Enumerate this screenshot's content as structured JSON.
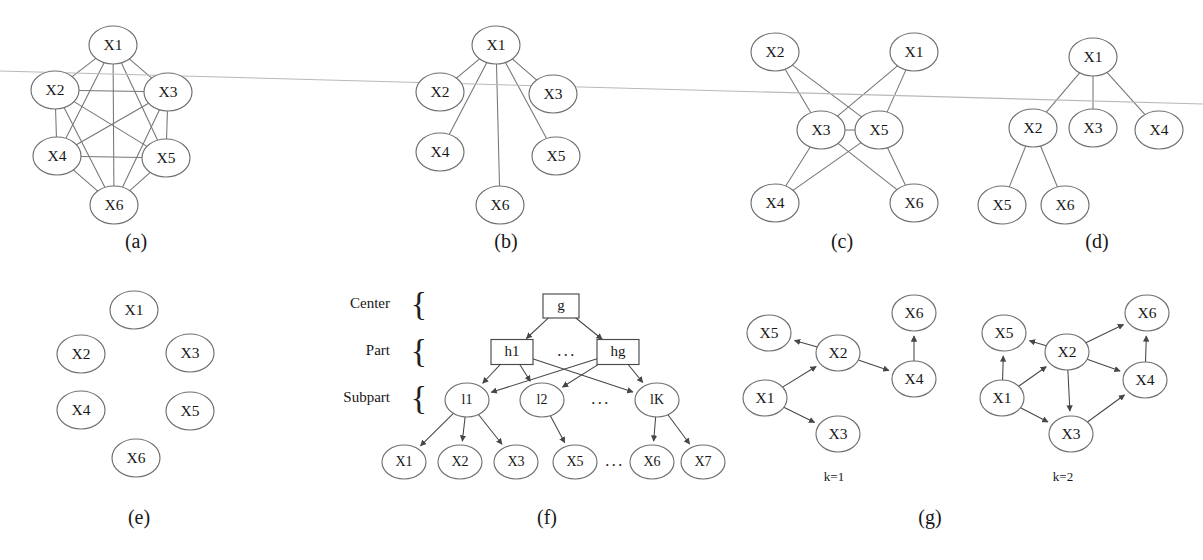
{
  "figure": {
    "background_color": "#ffffff",
    "node_stroke_color": "#6f6f70",
    "edge_color": "#74747a",
    "text_color": "#171717",
    "scan_artifact_color": "#b9b9bc"
  },
  "panels": [
    {
      "id": "a",
      "caption": "(a)",
      "type": "undirected-complete-graph",
      "nodes": [
        {
          "id": "X1",
          "label": "X1",
          "cx": 113,
          "cy": 45
        },
        {
          "id": "X2",
          "label": "X2",
          "cx": 55,
          "cy": 90
        },
        {
          "id": "X3",
          "label": "X3",
          "cx": 168,
          "cy": 92
        },
        {
          "id": "X4",
          "label": "X4",
          "cx": 57,
          "cy": 156
        },
        {
          "id": "X5",
          "label": "X5",
          "cx": 166,
          "cy": 158
        },
        {
          "id": "X6",
          "label": "X6",
          "cx": 114,
          "cy": 205
        }
      ],
      "edges": [
        [
          "X1",
          "X2"
        ],
        [
          "X1",
          "X3"
        ],
        [
          "X1",
          "X4"
        ],
        [
          "X1",
          "X5"
        ],
        [
          "X1",
          "X6"
        ],
        [
          "X2",
          "X3"
        ],
        [
          "X2",
          "X4"
        ],
        [
          "X2",
          "X5"
        ],
        [
          "X2",
          "X6"
        ],
        [
          "X3",
          "X4"
        ],
        [
          "X3",
          "X5"
        ],
        [
          "X3",
          "X6"
        ],
        [
          "X4",
          "X5"
        ],
        [
          "X4",
          "X6"
        ],
        [
          "X5",
          "X6"
        ]
      ]
    },
    {
      "id": "b",
      "caption": "(b)",
      "type": "undirected-star-graph",
      "nodes": [
        {
          "id": "X1",
          "label": "X1",
          "cx": 496,
          "cy": 45
        },
        {
          "id": "X2",
          "label": "X2",
          "cx": 440,
          "cy": 92
        },
        {
          "id": "X3",
          "label": "X3",
          "cx": 553,
          "cy": 94
        },
        {
          "id": "X4",
          "label": "X4",
          "cx": 440,
          "cy": 152
        },
        {
          "id": "X5",
          "label": "X5",
          "cx": 556,
          "cy": 156
        },
        {
          "id": "X6",
          "label": "X6",
          "cx": 500,
          "cy": 205
        }
      ],
      "edges": [
        [
          "X1",
          "X2"
        ],
        [
          "X1",
          "X3"
        ],
        [
          "X1",
          "X4"
        ],
        [
          "X1",
          "X5"
        ],
        [
          "X1",
          "X6"
        ]
      ]
    },
    {
      "id": "c",
      "caption": "(c)",
      "type": "undirected-graph",
      "nodes": [
        {
          "id": "X2",
          "label": "X2",
          "cx": 775,
          "cy": 52
        },
        {
          "id": "X1",
          "label": "X1",
          "cx": 914,
          "cy": 52
        },
        {
          "id": "X3",
          "label": "X3",
          "cx": 821,
          "cy": 130
        },
        {
          "id": "X5",
          "label": "X5",
          "cx": 879,
          "cy": 130
        },
        {
          "id": "X4",
          "label": "X4",
          "cx": 775,
          "cy": 203
        },
        {
          "id": "X6",
          "label": "X6",
          "cx": 914,
          "cy": 203
        }
      ],
      "edges": [
        [
          "X3",
          "X5"
        ],
        [
          "X2",
          "X3"
        ],
        [
          "X2",
          "X5"
        ],
        [
          "X1",
          "X3"
        ],
        [
          "X1",
          "X5"
        ],
        [
          "X4",
          "X3"
        ],
        [
          "X4",
          "X5"
        ],
        [
          "X6",
          "X3"
        ],
        [
          "X6",
          "X5"
        ]
      ]
    },
    {
      "id": "d",
      "caption": "(d)",
      "type": "undirected-tree",
      "nodes": [
        {
          "id": "X1",
          "label": "X1",
          "cx": 1093,
          "cy": 57
        },
        {
          "id": "X2",
          "label": "X2",
          "cx": 1033,
          "cy": 128
        },
        {
          "id": "X3",
          "label": "X3",
          "cx": 1093,
          "cy": 128
        },
        {
          "id": "X4",
          "label": "X4",
          "cx": 1159,
          "cy": 130
        },
        {
          "id": "X5",
          "label": "X5",
          "cx": 1002,
          "cy": 205
        },
        {
          "id": "X6",
          "label": "X6",
          "cx": 1065,
          "cy": 205
        }
      ],
      "edges": [
        [
          "X1",
          "X2"
        ],
        [
          "X1",
          "X3"
        ],
        [
          "X1",
          "X4"
        ],
        [
          "X2",
          "X5"
        ],
        [
          "X2",
          "X6"
        ]
      ]
    },
    {
      "id": "e",
      "caption": "(e)",
      "type": "empty-graph",
      "nodes": [
        {
          "id": "X1",
          "label": "X1",
          "cx": 134,
          "cy": 310
        },
        {
          "id": "X2",
          "label": "X2",
          "cx": 81,
          "cy": 354
        },
        {
          "id": "X3",
          "label": "X3",
          "cx": 190,
          "cy": 353
        },
        {
          "id": "X4",
          "label": "X4",
          "cx": 81,
          "cy": 410
        },
        {
          "id": "X5",
          "label": "X5",
          "cx": 190,
          "cy": 411
        },
        {
          "id": "X6",
          "label": "X6",
          "cx": 136,
          "cy": 458
        }
      ],
      "edges": []
    },
    {
      "id": "f",
      "caption": "(f)",
      "type": "hierarchy-dag",
      "tiers": [
        {
          "label": "Center",
          "brace": "{",
          "label_x": 390,
          "label_y": 305,
          "brace_x": 419,
          "brace_y": 307
        },
        {
          "label": "Part",
          "brace": "{",
          "label_x": 390,
          "label_y": 352,
          "brace_x": 419,
          "brace_y": 354
        },
        {
          "label": "Subpart",
          "brace": "{",
          "label_x": 390,
          "label_y": 399,
          "brace_x": 419,
          "brace_y": 401
        }
      ],
      "boxes": [
        {
          "id": "g",
          "label": "g",
          "cx": 561,
          "cy": 306,
          "w": 36,
          "h": 24
        },
        {
          "id": "h1",
          "label": "h1",
          "cx": 512,
          "cy": 352,
          "w": 42,
          "h": 25
        },
        {
          "id": "hg",
          "label": "hg",
          "cx": 618,
          "cy": 352,
          "w": 42,
          "h": 25
        }
      ],
      "ellipses": [
        {
          "id": "l1",
          "label": "l1",
          "cx": 467,
          "cy": 400
        },
        {
          "id": "l2",
          "label": "l2",
          "cx": 542,
          "cy": 400
        },
        {
          "id": "lK",
          "label": "lK",
          "cx": 657,
          "cy": 400
        },
        {
          "id": "X1",
          "label": "X1",
          "cx": 404,
          "cy": 462
        },
        {
          "id": "X2",
          "label": "X2",
          "cx": 460,
          "cy": 462
        },
        {
          "id": "X3",
          "label": "X3",
          "cx": 516,
          "cy": 462
        },
        {
          "id": "X5",
          "label": "X5",
          "cx": 575,
          "cy": 462
        },
        {
          "id": "X6",
          "label": "X6",
          "cx": 652,
          "cy": 462
        },
        {
          "id": "X7",
          "label": "X7",
          "cx": 703,
          "cy": 462
        }
      ],
      "ellipsis_marks": [
        {
          "text": "...",
          "x": 567,
          "y": 352
        },
        {
          "text": "...",
          "x": 601,
          "y": 400
        },
        {
          "text": "...",
          "x": 615,
          "y": 462
        }
      ],
      "edges": [
        [
          "g",
          "h1"
        ],
        [
          "g",
          "hg"
        ],
        [
          "h1",
          "l1"
        ],
        [
          "h1",
          "l2"
        ],
        [
          "h1",
          "lK"
        ],
        [
          "hg",
          "l1"
        ],
        [
          "hg",
          "l2"
        ],
        [
          "hg",
          "lK"
        ],
        [
          "l1",
          "X1"
        ],
        [
          "l1",
          "X2"
        ],
        [
          "l1",
          "X3"
        ],
        [
          "l2",
          "X5"
        ],
        [
          "lK",
          "X6"
        ],
        [
          "lK",
          "X7"
        ]
      ]
    },
    {
      "id": "g",
      "caption": "(g)",
      "type": "directed-graphs",
      "subfigures": [
        {
          "caption": "k=1",
          "caption_x": 834,
          "caption_y": 478,
          "nodes": [
            {
              "id": "X5",
              "label": "X5",
              "cx": 769,
              "cy": 333
            },
            {
              "id": "X2",
              "label": "X2",
              "cx": 838,
              "cy": 353
            },
            {
              "id": "X6",
              "label": "X6",
              "cx": 914,
              "cy": 313
            },
            {
              "id": "X4",
              "label": "X4",
              "cx": 914,
              "cy": 379
            },
            {
              "id": "X1",
              "label": "X1",
              "cx": 765,
              "cy": 398
            },
            {
              "id": "X3",
              "label": "X3",
              "cx": 838,
              "cy": 434
            }
          ],
          "edges": [
            [
              "X1",
              "X2"
            ],
            [
              "X1",
              "X3"
            ],
            [
              "X2",
              "X5"
            ],
            [
              "X2",
              "X4"
            ],
            [
              "X4",
              "X6"
            ]
          ]
        },
        {
          "caption": "k=2",
          "caption_x": 1063,
          "caption_y": 478,
          "nodes": [
            {
              "id": "X5",
              "label": "X5",
              "cx": 1004,
              "cy": 333
            },
            {
              "id": "X6",
              "label": "X6",
              "cx": 1147,
              "cy": 313
            },
            {
              "id": "X2",
              "label": "X2",
              "cx": 1067,
              "cy": 352
            },
            {
              "id": "X4",
              "label": "X4",
              "cx": 1145,
              "cy": 380
            },
            {
              "id": "X1",
              "label": "X1",
              "cx": 1002,
              "cy": 398
            },
            {
              "id": "X3",
              "label": "X3",
              "cx": 1071,
              "cy": 434
            }
          ],
          "edges": [
            [
              "X1",
              "X5"
            ],
            [
              "X1",
              "X2"
            ],
            [
              "X1",
              "X3"
            ],
            [
              "X2",
              "X5"
            ],
            [
              "X2",
              "X6"
            ],
            [
              "X2",
              "X4"
            ],
            [
              "X2",
              "X3"
            ],
            [
              "X3",
              "X4"
            ],
            [
              "X4",
              "X6"
            ]
          ]
        }
      ]
    }
  ],
  "captions": [
    {
      "text": "(a)",
      "x": 136,
      "y": 243
    },
    {
      "text": "(b)",
      "x": 506,
      "y": 243
    },
    {
      "text": "(c)",
      "x": 842,
      "y": 243
    },
    {
      "text": "(d)",
      "x": 1097,
      "y": 243
    },
    {
      "text": "(e)",
      "x": 139,
      "y": 519
    },
    {
      "text": "(f)",
      "x": 547,
      "y": 519
    },
    {
      "text": "(g)",
      "x": 930,
      "y": 519
    }
  ],
  "scan_artifact": {
    "x1": 0,
    "y1": 71,
    "x2": 1203,
    "y2": 104
  },
  "node_radius": {
    "rx": 24,
    "ry": 19,
    "rx_small": 22,
    "ry_small": 17
  }
}
